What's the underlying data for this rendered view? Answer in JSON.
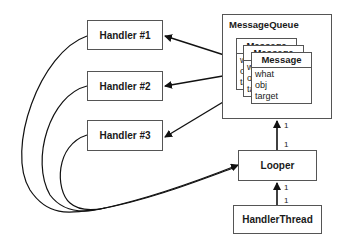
{
  "diagram": {
    "handlers": [
      {
        "label": "Handler #1"
      },
      {
        "label": "Handler #2"
      },
      {
        "label": "Handler #3"
      }
    ],
    "message_queue": {
      "title": "MessageQueue",
      "messages": [
        {
          "title": "Message",
          "fields": [
            "what",
            "obj",
            "target"
          ]
        },
        {
          "title": "Message",
          "fields": [
            "what",
            "obj",
            "target"
          ]
        },
        {
          "title": "Message",
          "fields": [
            "what",
            "obj",
            "target"
          ]
        }
      ]
    },
    "looper": {
      "label": "Looper"
    },
    "handler_thread": {
      "label": "HandlerThread"
    },
    "multiplicities": {
      "queue_end": "1",
      "looper_to_queue": "1",
      "looper_to_thread": "1",
      "thread_end": "1"
    },
    "edges": [
      {
        "from": "message-3-target",
        "to": "Handler #1",
        "type": "arrow"
      },
      {
        "from": "message-2-target",
        "to": "Handler #2",
        "type": "arrow"
      },
      {
        "from": "message-1-target",
        "to": "Handler #3",
        "type": "arrow"
      },
      {
        "from": "Handler #1",
        "to": "Looper",
        "type": "curve-arrow"
      },
      {
        "from": "Handler #2",
        "to": "Looper",
        "type": "curve-arrow"
      },
      {
        "from": "Handler #3",
        "to": "Looper",
        "type": "curve-arrow"
      },
      {
        "from": "Looper",
        "to": "MessageQueue",
        "type": "arrow"
      },
      {
        "from": "HandlerThread",
        "to": "Looper",
        "type": "arrow"
      }
    ]
  }
}
